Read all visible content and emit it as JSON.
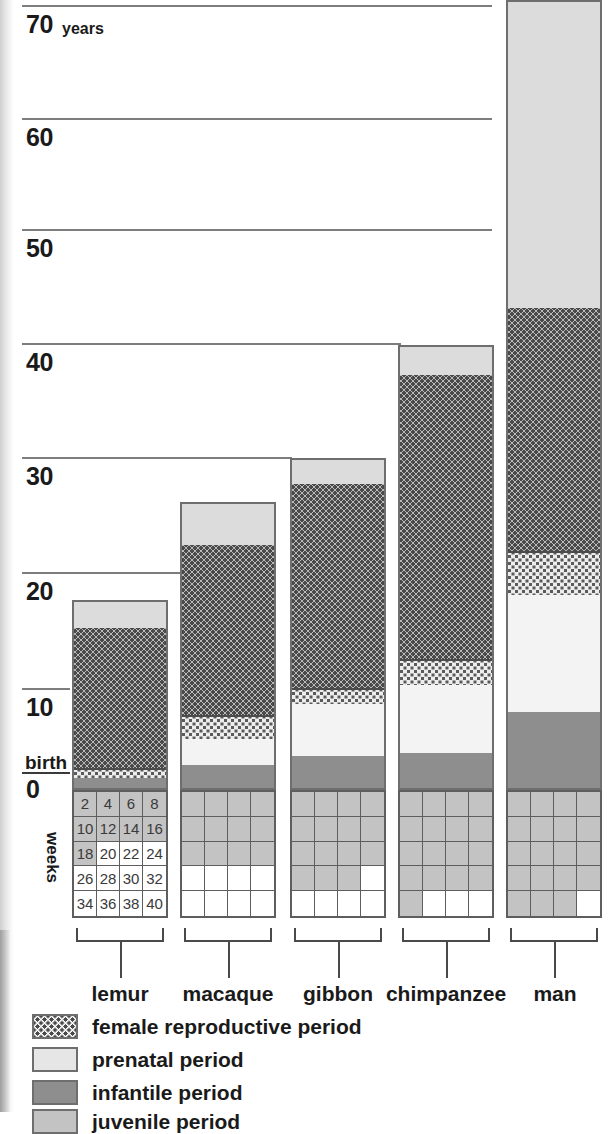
{
  "chart_data": {
    "type": "bar",
    "title": "",
    "ylabel": "years",
    "xlabel": "",
    "ylim": [
      0,
      72
    ],
    "grid": true,
    "y_ticks": [
      0,
      10,
      20,
      30,
      40,
      50,
      60,
      70
    ],
    "y_tick_labels": [
      "0",
      "10",
      "20",
      "30",
      "40",
      "50",
      "60",
      "70"
    ],
    "y_unit_label": "years",
    "birth_label": "birth",
    "weeks_axis_label": "weeks",
    "week_cells": [
      [
        "2",
        "4",
        "6",
        "8"
      ],
      [
        "10",
        "12",
        "14",
        "16"
      ],
      [
        "18",
        "20",
        "22",
        "24"
      ],
      [
        "26",
        "28",
        "30",
        "32"
      ],
      [
        "34",
        "36",
        "38",
        "40"
      ]
    ],
    "categories": [
      "lemur",
      "macaque",
      "gibbon",
      "chimpanzee",
      "man"
    ],
    "legend_position": "bottom-left",
    "series": [
      {
        "name": "infantile period",
        "key": "infantile",
        "color": "#8e8e8e",
        "values": [
          1.0,
          1.7,
          3.0,
          3.0,
          6.5
        ]
      },
      {
        "name": "juvenile period",
        "key": "juvenile",
        "color": "#c3c3c3",
        "values": [
          0.6,
          2.5,
          5.3,
          8.0,
          9.5
        ]
      },
      {
        "name": "female reproductive period",
        "key": "repro",
        "color": "#b9b9b9",
        "values": [
          15.0,
          19.0,
          19.5,
          24.0,
          28.0
        ]
      },
      {
        "name": "post-reproductive period",
        "key": "post",
        "color": "#dcdcdc",
        "values": [
          2.4,
          3.8,
          2.2,
          5.0,
          27.0
        ]
      }
    ],
    "totals": [
      19.0,
      27.0,
      30.0,
      40.0,
      71.0
    ],
    "gestation_weeks": [
      18,
      24,
      30,
      34,
      38
    ],
    "gestation_note": "shaded cells of the 40-week grid indicate gestation length",
    "annotations": []
  },
  "legend": {
    "items": [
      {
        "label": "female reproductive period",
        "swatch": "repro"
      },
      {
        "label": "prenatal period",
        "swatch": "prenatal"
      },
      {
        "label": "infantile period",
        "swatch": "infantile"
      },
      {
        "label": "juvenile period",
        "swatch": "juvenile"
      }
    ]
  }
}
